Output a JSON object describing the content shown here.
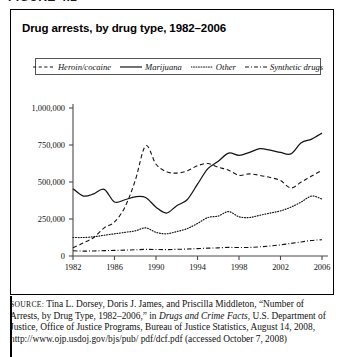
{
  "figure": {
    "label": "FIGURE 4.2",
    "title": "Drug arrests, by drug type, 1982–2006"
  },
  "legend": {
    "position": "top-center",
    "entries": [
      {
        "label": "Heroin/cocaine",
        "style": "dashed",
        "icon": "dashed-line-icon"
      },
      {
        "label": "Marijuana",
        "style": "solid",
        "icon": "solid-line-icon"
      },
      {
        "label": "Other",
        "style": "dotted",
        "icon": "dotted-line-icon"
      },
      {
        "label": "Synthetic drugs",
        "style": "dash-dot",
        "icon": "dash-dot-line-icon"
      }
    ]
  },
  "source": {
    "prefix": "SOURCE:",
    "line1": " Tina L. Dorsey, Doris J. James, and Priscilla Middleton,",
    "line2_pre": "“Number of Arrests, by Drug Type, 1982–2006,” in ",
    "line2_ital": "Drugs and Crime",
    "line3_ital": "Facts",
    "line3_post": ", U.S. Department of Justice, Office of Justice Programs, Bureau",
    "line4": "of Justice Statistics, August 14, 2008, http://www.ojp.usdoj.gov/bjs/pub/",
    "line5": "pdf/dcf.pdf (accessed October 7, 2008)"
  },
  "chart_data": {
    "type": "line",
    "title": "Drug arrests, by drug type, 1982–2006",
    "xlabel": "",
    "ylabel": "",
    "xlim": [
      1982,
      2006
    ],
    "ylim": [
      0,
      1000000
    ],
    "grid": false,
    "legend_position": "top-center",
    "x": [
      1982,
      1983,
      1984,
      1985,
      1986,
      1987,
      1988,
      1989,
      1990,
      1991,
      1992,
      1993,
      1994,
      1995,
      1996,
      1997,
      1998,
      1999,
      2000,
      2001,
      2002,
      2003,
      2004,
      2005,
      2006
    ],
    "xticks": [
      1982,
      1986,
      1990,
      1994,
      1998,
      2002,
      2006
    ],
    "xtick_labels": [
      "1982",
      "1986",
      "1990",
      "1994",
      "1998",
      "2002",
      "2006"
    ],
    "yticks": [
      0,
      250000,
      500000,
      750000,
      1000000
    ],
    "ytick_labels": [
      "0",
      "250,000",
      "500,000",
      "750,000",
      "1,000,000"
    ],
    "series": [
      {
        "name": "Heroin/cocaine",
        "style": "dashed",
        "values": [
          55000,
          88000,
          125000,
          190000,
          230000,
          330000,
          510000,
          745000,
          620000,
          570000,
          560000,
          575000,
          610000,
          625000,
          600000,
          580000,
          545000,
          555000,
          545000,
          530000,
          510000,
          460000,
          500000,
          540000,
          580000
        ]
      },
      {
        "name": "Marijuana",
        "style": "solid",
        "values": [
          455000,
          405000,
          420000,
          450000,
          365000,
          380000,
          400000,
          395000,
          330000,
          290000,
          340000,
          380000,
          485000,
          590000,
          640000,
          695000,
          680000,
          700000,
          725000,
          715000,
          700000,
          690000,
          765000,
          790000,
          830000
        ]
      },
      {
        "name": "Other",
        "style": "dotted",
        "values": [
          125000,
          125000,
          130000,
          140000,
          150000,
          160000,
          170000,
          190000,
          160000,
          150000,
          165000,
          185000,
          220000,
          260000,
          270000,
          300000,
          265000,
          260000,
          275000,
          290000,
          305000,
          330000,
          365000,
          405000,
          385000
        ]
      },
      {
        "name": "Synthetic drugs",
        "style": "dash-dot",
        "values": [
          35000,
          33000,
          34000,
          36000,
          38000,
          40000,
          42000,
          45000,
          44000,
          43000,
          45000,
          47000,
          50000,
          53000,
          55000,
          58000,
          57000,
          58000,
          62000,
          68000,
          75000,
          85000,
          95000,
          105000,
          110000
        ]
      }
    ]
  }
}
